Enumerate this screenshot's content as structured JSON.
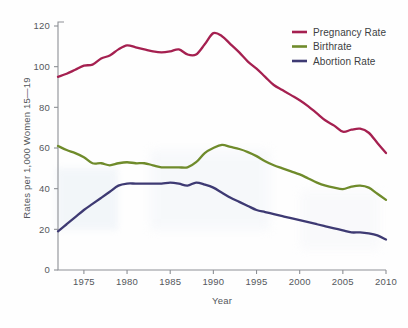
{
  "chart_data": {
    "type": "line",
    "title": "",
    "subtitle": "",
    "xlabel": "Year",
    "ylabel": "Rates per 1,000 Women 15—19",
    "xlim": [
      1972,
      2010
    ],
    "ylim": [
      0,
      120
    ],
    "yticks": [
      0,
      20,
      40,
      60,
      80,
      100,
      120
    ],
    "ytick_labels": [
      "0",
      "20",
      "40",
      "60",
      "80",
      "100",
      "120"
    ],
    "xticks": [
      1975,
      1980,
      1985,
      1990,
      1995,
      2000,
      2005,
      2010
    ],
    "xtick_labels": [
      "1975",
      "1980",
      "1985",
      "1990",
      "1995",
      "2000",
      "2005",
      "2010"
    ],
    "grid": false,
    "legend_position": "top-right",
    "x": [
      1972,
      1973,
      1974,
      1975,
      1976,
      1977,
      1978,
      1979,
      1980,
      1981,
      1982,
      1983,
      1984,
      1985,
      1986,
      1987,
      1988,
      1989,
      1990,
      1991,
      1992,
      1993,
      1994,
      1995,
      1996,
      1997,
      1998,
      1999,
      2000,
      2001,
      2002,
      2003,
      2004,
      2005,
      2006,
      2007,
      2008,
      2009,
      2010
    ],
    "series": [
      {
        "name": "Pregnancy Rate",
        "color": "#A52050",
        "values": [
          95.0,
          96.5,
          98.5,
          100.5,
          101.0,
          104.0,
          105.5,
          108.5,
          110.5,
          109.5,
          108.5,
          107.5,
          107.0,
          107.5,
          108.5,
          106.0,
          106.0,
          111.0,
          116.5,
          115.0,
          111.0,
          107.0,
          102.5,
          99.0,
          95.0,
          91.0,
          88.5,
          86.0,
          83.5,
          80.5,
          77.0,
          73.5,
          71.0,
          68.0,
          69.0,
          69.5,
          67.5,
          62.5,
          57.5
        ]
      },
      {
        "name": "Birthrate",
        "color": "#6F8B2B",
        "values": [
          61.0,
          59.0,
          57.5,
          55.5,
          52.5,
          52.5,
          51.5,
          52.5,
          53.0,
          52.5,
          52.5,
          51.5,
          50.5,
          50.5,
          50.5,
          50.5,
          53.0,
          57.5,
          60.0,
          61.5,
          60.5,
          59.5,
          58.0,
          56.0,
          53.5,
          51.5,
          50.0,
          48.5,
          47.0,
          45.0,
          43.0,
          41.5,
          40.5,
          39.8,
          41.0,
          41.5,
          40.5,
          37.5,
          34.5
        ]
      },
      {
        "name": "Abortion Rate",
        "color": "#3E3A73",
        "values": [
          19.0,
          22.5,
          26.0,
          29.5,
          32.5,
          35.5,
          38.5,
          41.5,
          42.5,
          42.5,
          42.5,
          42.5,
          42.5,
          43.0,
          42.5,
          41.5,
          43.0,
          42.0,
          40.5,
          38.0,
          35.5,
          33.5,
          31.5,
          29.5,
          28.5,
          27.5,
          26.5,
          25.5,
          24.5,
          23.5,
          22.5,
          21.5,
          20.5,
          19.5,
          18.5,
          18.5,
          18.0,
          17.0,
          15.0
        ]
      }
    ],
    "legend": [
      {
        "label": "Pregnancy Rate",
        "color": "#A52050"
      },
      {
        "label": "Birthrate",
        "color": "#6F8B2B"
      },
      {
        "label": "Abortion Rate",
        "color": "#3E3A73"
      }
    ]
  }
}
